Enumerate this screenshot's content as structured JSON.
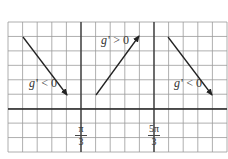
{
  "diagram": {
    "type": "sign-of-derivative sketch on grid",
    "grid": {
      "left": 8,
      "top": 22,
      "right": 227,
      "bottom": 152,
      "cols": 15,
      "rows": 9,
      "color": "#9a9a9a"
    },
    "x_axis": {
      "y": 109,
      "color": "#222222"
    },
    "vertical_markers": [
      {
        "x": 81,
        "num": "π",
        "den": "3"
      },
      {
        "x": 154,
        "num": "5π",
        "den": "3"
      }
    ],
    "arrows": [
      {
        "x1": 23,
        "y1": 37,
        "x2": 67,
        "y2": 95,
        "label": "g' < 0",
        "label_x": 29,
        "label_y": 83
      },
      {
        "x1": 96,
        "y1": 95,
        "x2": 139,
        "y2": 36,
        "label": "g' > 0",
        "label_x": 101,
        "label_y": 40
      },
      {
        "x1": 168,
        "y1": 37,
        "x2": 212,
        "y2": 95,
        "label": "g' < 0",
        "label_x": 174,
        "label_y": 83
      }
    ]
  },
  "labels": {
    "arrow1": "g' < 0",
    "arrow2": "g' > 0",
    "arrow3": "g' < 0",
    "tick1_num": "π",
    "tick1_den": "3",
    "tick2_num": "5π",
    "tick2_den": "3"
  }
}
